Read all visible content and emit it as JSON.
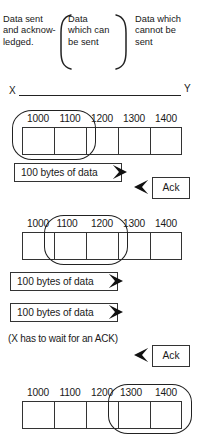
{
  "legend": {
    "acked": "Data sent and acknow- ledged.",
    "can_send": "Data which can be sent",
    "cannot_send": "Data which cannot be sent"
  },
  "axis": {
    "left_label": "X",
    "right_label": "Y"
  },
  "strips": [
    {
      "name": "initial-window",
      "sequence_numbers": [
        "1000",
        "1100",
        "1200",
        "1300",
        "1400"
      ],
      "window_start_index": 0,
      "window_end_index": 1,
      "clipped_labels": []
    },
    {
      "name": "slid-window",
      "sequence_numbers": [
        "1000",
        "1100",
        "1200",
        "1300",
        "1400"
      ],
      "window_start_index": 1,
      "window_end_index": 2,
      "clipped_labels": [
        1
      ]
    },
    {
      "name": "final-window",
      "sequence_numbers": [
        "1000",
        "1100",
        "1200",
        "1300",
        "1400"
      ],
      "window_start_index": 3,
      "window_end_index": 4,
      "clipped_labels": [
        3
      ]
    }
  ],
  "packets": [
    {
      "label": "100 bytes of data"
    },
    {
      "label": "100 bytes of data"
    },
    {
      "label": "100 bytes of data"
    }
  ],
  "acks": [
    {
      "label": "Ack"
    },
    {
      "label": "Ack"
    }
  ],
  "note": "(X has to wait for an ACK)",
  "colors": {
    "ink": "#1a1a1a",
    "stroke": "#333333",
    "paper": "#ffffff"
  }
}
